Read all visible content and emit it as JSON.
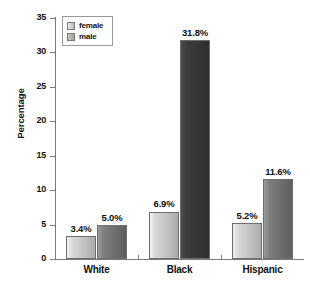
{
  "chart_data": {
    "type": "bar",
    "title": "",
    "xlabel": "",
    "ylabel": "Percentage",
    "ylim": [
      0,
      35
    ],
    "yticks": [
      0,
      5,
      10,
      15,
      20,
      25,
      30,
      35
    ],
    "ytick_labels": [
      "0",
      "5",
      "10",
      "15",
      "20",
      "25",
      "30",
      "35"
    ],
    "grid": false,
    "legend_position": "upper left (inside plot)",
    "categories": [
      "White",
      "Black",
      "Hispanic"
    ],
    "series": [
      {
        "name": "female",
        "color": "#c4c4c4",
        "values": [
          3.4,
          6.9,
          5.2
        ],
        "labels": [
          "3.4%",
          "6.9%",
          "5.2%"
        ]
      },
      {
        "name": "male",
        "color": "#6e6e6e",
        "values": [
          5.0,
          31.8,
          11.6
        ],
        "labels": [
          "5.0%",
          "31.8%",
          "11.6%"
        ]
      }
    ]
  },
  "legend": {
    "items": [
      {
        "label": "female",
        "swatch": "female-swatch-icon"
      },
      {
        "label": "male",
        "swatch": "male-swatch-icon"
      }
    ]
  },
  "colors": {
    "axis": "#7a7a7a",
    "text": "#111111",
    "background": "#ffffff",
    "female_bar": "#c4c4c4",
    "male_bar": "#6e6e6e",
    "male_bar_dark": "#3a3a3a"
  }
}
